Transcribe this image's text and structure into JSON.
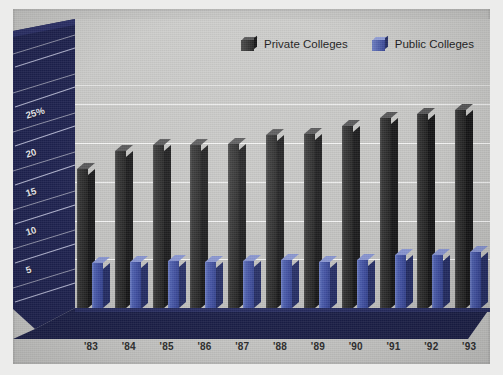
{
  "chart_data": {
    "type": "bar",
    "title": "",
    "subtitle": "",
    "xlabel": "",
    "ylabel": "25%",
    "categories": [
      "'83",
      "'84",
      "'85",
      "'86",
      "'87",
      "'88",
      "'89",
      "'90",
      "'91",
      "'92",
      "'93"
    ],
    "series": [
      {
        "name": "Private Colleges",
        "color": "#2a2a2a",
        "values": [
          17.9,
          20.2,
          21.0,
          21.0,
          21.2,
          22.3,
          22.5,
          23.5,
          24.5,
          25.0,
          25.5
        ]
      },
      {
        "name": "Public Colleges",
        "color": "#4d5fae",
        "values": [
          5.8,
          6.0,
          6.1,
          6.0,
          6.1,
          6.2,
          6.0,
          6.2,
          6.8,
          6.9,
          7.2
        ]
      }
    ],
    "ylim": [
      0,
      27
    ],
    "yticks": [
      5,
      10,
      15,
      20,
      25
    ],
    "ytick_labels": [
      "5",
      "10",
      "15",
      "20",
      "25%"
    ],
    "grid": true,
    "legend_position": "top-right",
    "style": "3d-bar"
  },
  "legend": {
    "entries": [
      {
        "label": "Private Colleges",
        "swatch": "dark-gray-3d-box"
      },
      {
        "label": "Public Colleges",
        "swatch": "blue-3d-box"
      }
    ]
  },
  "axis": {
    "y_labels": [
      "25%",
      "20",
      "15",
      "10",
      "5"
    ],
    "x_labels": [
      "'83",
      "'84",
      "'85",
      "'86",
      "'87",
      "'88",
      "'89",
      "'90",
      "'91",
      "'92",
      "'93"
    ]
  },
  "colors": {
    "background": "#c8c8c6",
    "page": "#ececeb",
    "wall_back": "#c6c6c4",
    "wall_left": "#1e2250",
    "floor": "#1b1f48",
    "gridline": "#ffffff",
    "private": "#2a2a2a",
    "public": "#4d5fae"
  }
}
